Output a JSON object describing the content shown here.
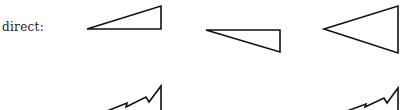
{
  "figure": {
    "label": "direct:",
    "stroke_color": "#111111",
    "background": "#ffffff",
    "shapes": [
      {
        "name": "triangle-1",
        "points": "87,29 161,6 161,29"
      },
      {
        "name": "triangle-2",
        "points": "206,30 280,30 280,52"
      },
      {
        "name": "triangle-3",
        "points": "324,29 398,6 398,53"
      },
      {
        "name": "zigzag-1",
        "points": "107,111 127,103 126,107 146,97 149,102 161,86 161,111"
      },
      {
        "name": "zigzag-2",
        "points": "347,111 366,104 365,107 384,98 387,103 398,88 398,111"
      }
    ]
  }
}
